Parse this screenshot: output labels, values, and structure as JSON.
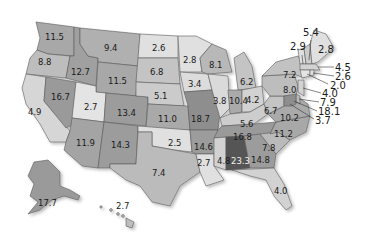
{
  "map": {
    "title": "US states choropleth (grayscale)",
    "shading": {
      "very_light": "#e4e4e4",
      "light": "#c9c9c9",
      "medium": "#a8a8a8",
      "dark": "#8c8c8c",
      "darkest": "#555555"
    },
    "states": {
      "WA": "11.5",
      "OR": "8.8",
      "CA": "4.9",
      "ID": "12.7",
      "NV": "16.7",
      "MT": "9.4",
      "WY": "11.5",
      "UT": "2.7",
      "AZ": "11.9",
      "CO": "13.4",
      "NM": "14.3",
      "ND": "2.6",
      "SD": "6.8",
      "NE": "5.1",
      "KS": "11.0",
      "OK": "2.5",
      "TX": "7.4",
      "MN": "2.8",
      "IA": "3.4",
      "MO": "18.7",
      "AR": "14.6",
      "LA": "2.7",
      "WI": "8.1",
      "IL": "3.8",
      "MI": "6.2",
      "IN": "10.4",
      "OH": "4.2",
      "KY": "5.6",
      "TN": "16.8",
      "MS": "4.8",
      "AL": "23.3",
      "GA": "14.8",
      "FL": "4.0",
      "SC": "7.8",
      "NC": "11.2",
      "VA": "10.2",
      "WV": "6.7",
      "PA": "8.0",
      "NY": "7.2",
      "VT": "2.9",
      "NH": "5.4",
      "ME": "2.8",
      "MA": "4.5",
      "RI": "2.6",
      "CT": "2.0",
      "NJ": "4.0",
      "DE": "7.9",
      "MD": "18.1",
      "DC": "3.7",
      "AK": "17.7",
      "HI": "2.7"
    }
  }
}
